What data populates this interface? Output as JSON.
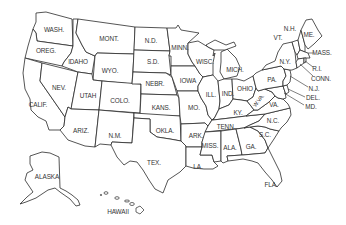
{
  "map": {
    "title": "United States",
    "line_color": "#2a2a2a",
    "fill_color": "#ffffff",
    "label_color": "#333333",
    "states": [
      {
        "id": "wa",
        "label": "WASH.",
        "x": 54,
        "y": 30
      },
      {
        "id": "or",
        "label": "OREG.",
        "x": 46,
        "y": 51
      },
      {
        "id": "ca",
        "label": "CALIF.",
        "x": 38,
        "y": 105
      },
      {
        "id": "nv",
        "label": "NEV.",
        "x": 59,
        "y": 88
      },
      {
        "id": "id",
        "label": "IDAHO",
        "x": 78,
        "y": 62
      },
      {
        "id": "mt",
        "label": "MONT.",
        "x": 109,
        "y": 39
      },
      {
        "id": "wy",
        "label": "WYO.",
        "x": 110,
        "y": 71
      },
      {
        "id": "ut",
        "label": "UTAH",
        "x": 88,
        "y": 96
      },
      {
        "id": "co",
        "label": "COLO.",
        "x": 120,
        "y": 101
      },
      {
        "id": "az",
        "label": "ARIZ.",
        "x": 81,
        "y": 131
      },
      {
        "id": "nm",
        "label": "N.M.",
        "x": 115,
        "y": 136
      },
      {
        "id": "nd",
        "label": "N.D.",
        "x": 151,
        "y": 41
      },
      {
        "id": "sd",
        "label": "S.D.",
        "x": 153,
        "y": 62
      },
      {
        "id": "ne",
        "label": "NEBR.",
        "x": 155,
        "y": 84
      },
      {
        "id": "ks",
        "label": "KANS.",
        "x": 161,
        "y": 108
      },
      {
        "id": "ok",
        "label": "OKLA.",
        "x": 165,
        "y": 131
      },
      {
        "id": "tx",
        "label": "TEX.",
        "x": 154,
        "y": 163
      },
      {
        "id": "mn",
        "label": "MINN.",
        "x": 180,
        "y": 48
      },
      {
        "id": "ia",
        "label": "IOWA",
        "x": 188,
        "y": 81
      },
      {
        "id": "mo",
        "label": "MO.",
        "x": 194,
        "y": 108
      },
      {
        "id": "ar",
        "label": "ARK.",
        "x": 196,
        "y": 136
      },
      {
        "id": "la",
        "label": "LA.",
        "x": 198,
        "y": 167
      },
      {
        "id": "wi",
        "label": "WISC.",
        "x": 205,
        "y": 62
      },
      {
        "id": "il",
        "label": "ILL.",
        "x": 211,
        "y": 95
      },
      {
        "id": "mi",
        "label": "MICH.",
        "x": 235,
        "y": 70
      },
      {
        "id": "in",
        "label": "IND.",
        "x": 228,
        "y": 94
      },
      {
        "id": "oh",
        "label": "OHIO",
        "x": 245,
        "y": 89
      },
      {
        "id": "ky",
        "label": "KY.",
        "x": 238,
        "y": 113
      },
      {
        "id": "tn",
        "label": "TENN.",
        "x": 226,
        "y": 127
      },
      {
        "id": "ms",
        "label": "MISS.",
        "x": 210,
        "y": 146
      },
      {
        "id": "al",
        "label": "ALA.",
        "x": 230,
        "y": 148
      },
      {
        "id": "ga",
        "label": "GA.",
        "x": 251,
        "y": 147
      },
      {
        "id": "fl",
        "label": "FLA.",
        "x": 271,
        "y": 185
      },
      {
        "id": "sc",
        "label": "S.C.",
        "x": 265,
        "y": 135
      },
      {
        "id": "nc",
        "label": "N.C.",
        "x": 273,
        "y": 121
      },
      {
        "id": "va",
        "label": "VA.",
        "x": 274,
        "y": 105
      },
      {
        "id": "wv",
        "label": "W.VA.",
        "x": 259,
        "y": 101,
        "rotated": true
      },
      {
        "id": "pa",
        "label": "PA.",
        "x": 272,
        "y": 80
      },
      {
        "id": "ny",
        "label": "N.Y.",
        "x": 285,
        "y": 62
      },
      {
        "id": "vt",
        "label": "VT.",
        "x": 278,
        "y": 38
      },
      {
        "id": "nh",
        "label": "N.H.",
        "x": 290,
        "y": 29
      },
      {
        "id": "me",
        "label": "ME.",
        "x": 309,
        "y": 35
      },
      {
        "id": "ma",
        "label": "MASS.",
        "x": 322,
        "y": 53
      },
      {
        "id": "ri",
        "label": "R.I.",
        "x": 317,
        "y": 69
      },
      {
        "id": "ct",
        "label": "CONN.",
        "x": 321,
        "y": 79
      },
      {
        "id": "nj",
        "label": "N.J.",
        "x": 314,
        "y": 89
      },
      {
        "id": "de",
        "label": "DEL.",
        "x": 313,
        "y": 98
      },
      {
        "id": "md",
        "label": "MD.",
        "x": 311,
        "y": 107
      },
      {
        "id": "ak",
        "label": "ALASKA",
        "x": 47,
        "y": 177
      },
      {
        "id": "hi",
        "label": "HAWAII",
        "x": 118,
        "y": 212
      }
    ]
  }
}
